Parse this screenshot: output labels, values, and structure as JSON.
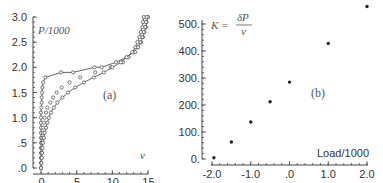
{
  "chart_data": [
    {
      "type": "line",
      "panel": "(a)",
      "title": "",
      "xlabel": "v",
      "ylabel": "P/1000",
      "xlim": [
        0,
        15
      ],
      "ylim": [
        0,
        3.0
      ],
      "xticks": [
        "0.",
        "5.",
        "10.",
        "15."
      ],
      "yticks": [
        ".0",
        ".5",
        "1.0",
        "1.5",
        "2.0",
        "2.5",
        "3.0"
      ],
      "grid": false,
      "legend": null,
      "series": [
        {
          "name": "loading branch (upper, solid line with circles)",
          "marker": "circle-open",
          "line": true,
          "points": [
            [
              0,
              0
            ],
            [
              0,
              0.1
            ],
            [
              0,
              0.2
            ],
            [
              0,
              0.3
            ],
            [
              0,
              0.4
            ],
            [
              0,
              0.5
            ],
            [
              0,
              0.6
            ],
            [
              0,
              0.7
            ],
            [
              0,
              0.8
            ],
            [
              0,
              0.9
            ],
            [
              0,
              1.0
            ],
            [
              0,
              1.1
            ],
            [
              0.05,
              1.2
            ],
            [
              0.1,
              1.3
            ],
            [
              0.1,
              1.4
            ],
            [
              0.15,
              1.5
            ],
            [
              0.2,
              1.6
            ],
            [
              0.3,
              1.7
            ],
            [
              0.6,
              1.8
            ],
            [
              2.8,
              1.9
            ],
            [
              4.5,
              1.9
            ],
            [
              7.5,
              2.0
            ],
            [
              8.5,
              2.0
            ],
            [
              10.5,
              2.1
            ],
            [
              12,
              2.2
            ],
            [
              13,
              2.3
            ],
            [
              13.6,
              2.4
            ],
            [
              14,
              2.5
            ],
            [
              14.3,
              2.6
            ],
            [
              14.5,
              2.7
            ],
            [
              14.7,
              2.8
            ],
            [
              14.8,
              2.9
            ],
            [
              15,
              3.0
            ]
          ]
        },
        {
          "name": "intermediate (circles only)",
          "marker": "circle-open",
          "line": false,
          "points": [
            [
              0,
              0
            ],
            [
              0,
              0.1
            ],
            [
              0.05,
              0.2
            ],
            [
              0.1,
              0.3
            ],
            [
              0.1,
              0.4
            ],
            [
              0.15,
              0.5
            ],
            [
              0.2,
              0.6
            ],
            [
              0.25,
              0.7
            ],
            [
              0.3,
              0.8
            ],
            [
              0.4,
              0.9
            ],
            [
              0.5,
              1.0
            ],
            [
              0.7,
              1.1
            ],
            [
              0.9,
              1.2
            ],
            [
              1.3,
              1.3
            ],
            [
              1.7,
              1.4
            ],
            [
              2.2,
              1.5
            ],
            [
              2.9,
              1.6
            ],
            [
              4.0,
              1.7
            ],
            [
              5.5,
              1.8
            ],
            [
              7.6,
              1.9
            ],
            [
              9.8,
              2.0
            ],
            [
              11.5,
              2.1
            ],
            [
              12.3,
              2.2
            ],
            [
              13.2,
              2.3
            ],
            [
              13.6,
              2.4
            ],
            [
              13.9,
              2.5
            ],
            [
              14.2,
              2.6
            ],
            [
              14.4,
              2.7
            ],
            [
              14.6,
              2.8
            ],
            [
              14.7,
              2.9
            ],
            [
              14.8,
              3.0
            ]
          ]
        },
        {
          "name": "unloading branch (lower, solid line with circles)",
          "marker": "circle-open",
          "line": true,
          "points": [
            [
              0,
              0
            ],
            [
              0.05,
              0.1
            ],
            [
              0.1,
              0.2
            ],
            [
              0.15,
              0.3
            ],
            [
              0.2,
              0.4
            ],
            [
              0.3,
              0.5
            ],
            [
              0.4,
              0.6
            ],
            [
              0.5,
              0.7
            ],
            [
              0.7,
              0.8
            ],
            [
              0.9,
              0.9
            ],
            [
              1.1,
              1.0
            ],
            [
              1.4,
              1.1
            ],
            [
              1.8,
              1.2
            ],
            [
              2.3,
              1.3
            ],
            [
              3.0,
              1.4
            ],
            [
              3.8,
              1.5
            ],
            [
              4.8,
              1.6
            ],
            [
              6.0,
              1.7
            ],
            [
              7.4,
              1.8
            ],
            [
              8.8,
              1.9
            ],
            [
              10.0,
              2.0
            ],
            [
              11.2,
              2.1
            ],
            [
              12.0,
              2.2
            ],
            [
              12.8,
              2.3
            ],
            [
              13.2,
              2.4
            ],
            [
              13.5,
              2.5
            ],
            [
              13.8,
              2.6
            ],
            [
              14.0,
              2.7
            ],
            [
              14.2,
              2.8
            ],
            [
              14.3,
              2.9
            ],
            [
              14.4,
              3.0
            ]
          ]
        }
      ],
      "annotations": [
        "P/1000",
        "(a)",
        "v"
      ]
    },
    {
      "type": "scatter",
      "panel": "(b)",
      "title": "",
      "xlabel": "Load/1000",
      "ylabel": "K = δP / v",
      "xlim": [
        -2.0,
        2.0
      ],
      "ylim": [
        0,
        500
      ],
      "xticks": [
        "-2.0",
        "-1.0",
        ".0",
        "1.0",
        "2.0"
      ],
      "yticks": [
        "0.",
        "100.",
        "200.",
        "300.",
        "400.",
        "500."
      ],
      "grid": false,
      "legend": null,
      "series": [
        {
          "name": "K",
          "marker": "filled-dot",
          "x": [
            -1.95,
            -1.5,
            -1.0,
            -0.5,
            0.0,
            1.0,
            2.0
          ],
          "y": [
            5,
            63,
            137,
            212,
            285,
            428,
            565
          ]
        }
      ],
      "annotations": [
        "K = δP / v",
        "(b)",
        "Load/1000"
      ]
    }
  ],
  "panel_a": {
    "ylabel": "P/1000",
    "xlabel": "v",
    "panel_label": "(a)",
    "xticks": [
      "0.",
      "5.",
      "10.",
      "15."
    ],
    "yticks": [
      ".0",
      ".5",
      "1.0",
      "1.5",
      "2.0",
      "2.5",
      "3.0"
    ]
  },
  "panel_b": {
    "ylabel_lhs": "K =",
    "ylabel_num": "δP",
    "ylabel_den": "v",
    "xlabel": "Load/1000",
    "panel_label": "(b)",
    "xticks": [
      "-2.0",
      "-1.0",
      ".0",
      "1.0",
      "2.0"
    ],
    "yticks": [
      "0.",
      "100.",
      "200.",
      "300.",
      "400.",
      "500."
    ]
  }
}
